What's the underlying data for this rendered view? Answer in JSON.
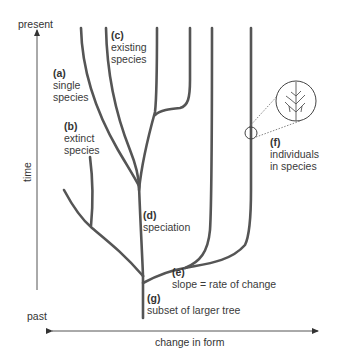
{
  "axes": {
    "y_top": "present",
    "y_bottom": "past",
    "y_label": "time",
    "x_label": "change in form"
  },
  "labels": [
    {
      "key": "(a)",
      "text_lines": [
        "single",
        "species"
      ]
    },
    {
      "key": "(b)",
      "text_lines": [
        "extinct",
        "species"
      ]
    },
    {
      "key": "(c)",
      "text_lines": [
        "existing",
        "species"
      ]
    },
    {
      "key": "(d)",
      "text_lines": [
        "speciation"
      ]
    },
    {
      "key": "(e)",
      "text_lines": [
        "slope = rate of change"
      ]
    },
    {
      "key": "(f)",
      "text_lines": [
        "individuals",
        "in species"
      ]
    },
    {
      "key": "(g)",
      "text_lines": [
        "subset of larger tree"
      ]
    }
  ],
  "colors": {
    "branch": "#555555",
    "axis": "#333333",
    "text": "#3a3a3a"
  }
}
